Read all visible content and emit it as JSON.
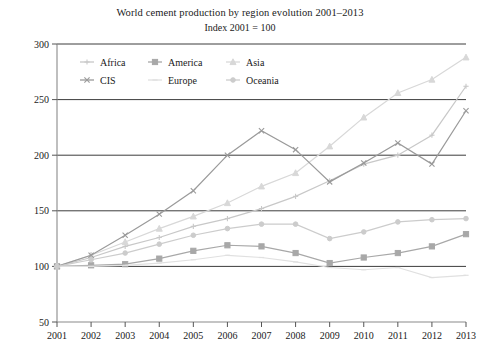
{
  "chart_data": {
    "type": "line",
    "title": "World cement production by region evolution 2001–2013",
    "subtitle": "Index 2001 = 100",
    "xlabel": "",
    "ylabel": "",
    "grid": true,
    "legend_position": "top-inside",
    "x": [
      2001,
      2002,
      2003,
      2004,
      2005,
      2006,
      2007,
      2008,
      2009,
      2010,
      2011,
      2012,
      2013
    ],
    "categories": [
      "2001",
      "2002",
      "2003",
      "2004",
      "2005",
      "2006",
      "2007",
      "2008",
      "2009",
      "2010",
      "2011",
      "2012",
      "2013"
    ],
    "ylim": [
      50,
      300
    ],
    "yticks": [
      50,
      100,
      150,
      200,
      250,
      300
    ],
    "xlim": [
      2001,
      2013
    ],
    "series": [
      {
        "name": "Africa",
        "color": "#c8c8c8",
        "marker": "plus",
        "values": [
          100,
          108,
          118,
          126,
          136,
          143,
          152,
          163,
          177,
          192,
          200,
          218,
          262
        ]
      },
      {
        "name": "America",
        "color": "#a8a8a8",
        "marker": "square",
        "values": [
          100,
          101,
          102,
          107,
          114,
          119,
          118,
          112,
          103,
          108,
          112,
          118,
          129
        ]
      },
      {
        "name": "Asia",
        "color": "#d8d8d8",
        "marker": "triangle",
        "values": [
          100,
          110,
          122,
          134,
          145,
          157,
          172,
          184,
          208,
          234,
          256,
          268,
          288
        ]
      },
      {
        "name": "CIS",
        "color": "#9a9a9a",
        "marker": "cross",
        "values": [
          100,
          110,
          128,
          147,
          168,
          200,
          222,
          205,
          176,
          193,
          211,
          192,
          240
        ]
      },
      {
        "name": "Europe",
        "color": "#e0e0e0",
        "marker": "line",
        "values": [
          100,
          100,
          101,
          103,
          106,
          110,
          108,
          104,
          99,
          97,
          99,
          90,
          92
        ]
      },
      {
        "name": "Oceania",
        "color": "#cccccc",
        "marker": "dot",
        "values": [
          100,
          106,
          112,
          120,
          128,
          134,
          138,
          138,
          125,
          131,
          140,
          142,
          143
        ]
      }
    ]
  },
  "legend": {
    "entries": [
      "Africa",
      "America",
      "Asia",
      "CIS",
      "Europe",
      "Oceania"
    ]
  },
  "axis": {
    "y_tick_labels": [
      "300",
      "250",
      "200",
      "150",
      "100",
      "50"
    ],
    "x_tick_labels": [
      "2001",
      "2002",
      "2003",
      "2004",
      "2005",
      "2006",
      "2007",
      "2008",
      "2009",
      "2010",
      "2011",
      "2012",
      "2013"
    ]
  }
}
